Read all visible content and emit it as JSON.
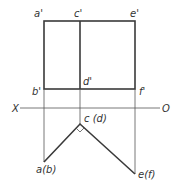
{
  "diagram": {
    "type": "orthographic-projection",
    "front_view_labels": {
      "a_prime": "a'",
      "c_prime": "c'",
      "e_prime": "e'",
      "b_prime": "b'",
      "d_prime": "d'",
      "f_prime": "f'"
    },
    "axis_labels": {
      "x": "X",
      "o": "O"
    },
    "top_view_labels": {
      "cd": "c (d)",
      "ab": "a(b)",
      "ef": "e(f)"
    },
    "colors": {
      "line": "#3a3a3a",
      "background": "#ffffff"
    }
  }
}
